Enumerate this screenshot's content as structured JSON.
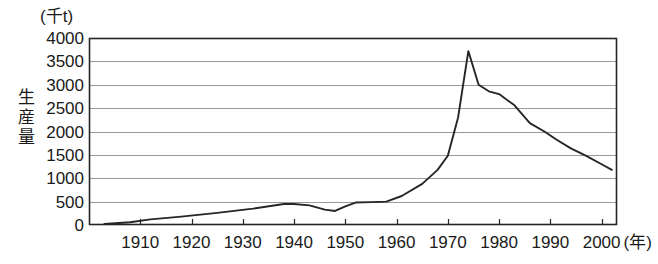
{
  "chart_data": {
    "type": "line",
    "title": "",
    "subtitle": "",
    "xlabel": "(年)",
    "ylabel": "生産量",
    "unit_label": "(千t)",
    "xlim": [
      1900,
      2003
    ],
    "ylim": [
      0,
      4000
    ],
    "grid": true,
    "legend": false,
    "legend_position": "none",
    "y_ticks": [
      4000,
      3500,
      3000,
      2500,
      2000,
      1500,
      1000,
      500,
      0
    ],
    "y_tick_labels": [
      "4000",
      "3500",
      "3000",
      "2500",
      "2000",
      "1500",
      "1000",
      "500",
      "0"
    ],
    "x_ticks": [
      1910,
      1920,
      1930,
      1940,
      1950,
      1960,
      1970,
      1980,
      1990,
      2000
    ],
    "x_tick_labels": [
      "1910",
      "1920",
      "1930",
      "1940",
      "1950",
      "1960",
      "1970",
      "1980",
      "1990",
      "2000"
    ],
    "series": [
      {
        "name": "生産量",
        "color": "#262626",
        "x": [
          1903,
          1908,
          1912,
          1918,
          1925,
          1932,
          1938,
          1940,
          1943,
          1946,
          1948,
          1950,
          1952,
          1955,
          1958,
          1961,
          1965,
          1968,
          1970,
          1972,
          1974,
          1976,
          1978,
          1980,
          1983,
          1986,
          1989,
          1991,
          1994,
          1997,
          2000,
          2002
        ],
        "y": [
          20,
          60,
          120,
          180,
          260,
          350,
          450,
          450,
          420,
          330,
          300,
          400,
          480,
          490,
          500,
          620,
          880,
          1180,
          1480,
          2300,
          3720,
          3000,
          2860,
          2800,
          2560,
          2180,
          1990,
          1840,
          1640,
          1480,
          1300,
          1180
        ]
      }
    ]
  },
  "axes_geometry": {
    "plot_left": 89,
    "plot_right": 617,
    "plot_top": 38,
    "plot_bottom": 225
  }
}
